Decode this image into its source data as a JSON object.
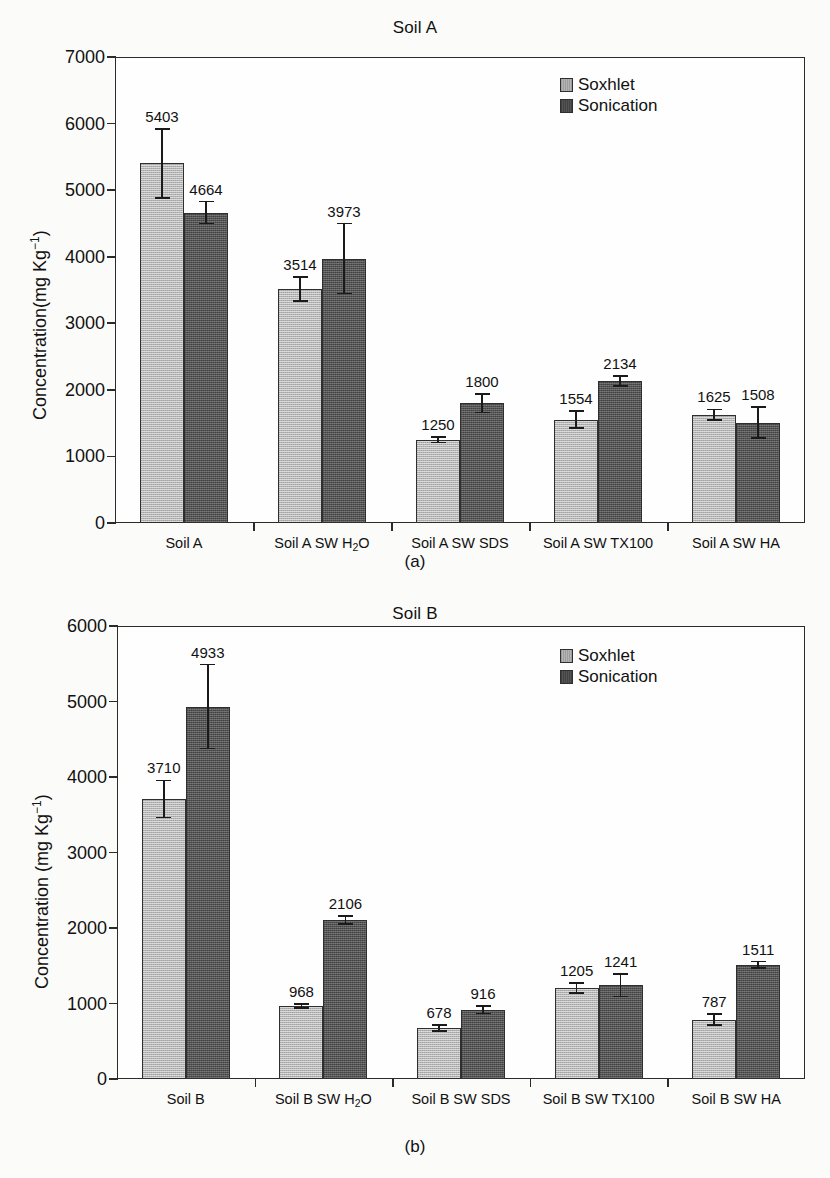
{
  "figure": {
    "legend_labels": [
      "Soxhlet",
      "Sonication"
    ],
    "colors": {
      "soxhlet": "#b4b4b4",
      "sonication": "#545454",
      "axis": "#2b2b2b",
      "text": "#111111"
    }
  },
  "panels": [
    {
      "id": "a",
      "caption": "(a)",
      "title": "Soil A",
      "ylabel_prefix": "Concentration(mg Kg",
      "ylabel_sup": "−1",
      "ylabel_suffix": ")",
      "yticks": [
        "0",
        "1000",
        "2000",
        "3000",
        "4000",
        "5000",
        "6000",
        "7000"
      ],
      "categories": [
        {
          "pre": "Soil A",
          "sub": "",
          "post": ""
        },
        {
          "pre": "Soil A SW H",
          "sub": "2",
          "post": "O"
        },
        {
          "pre": "Soil A SW SDS",
          "sub": "",
          "post": ""
        },
        {
          "pre": "Soil A SW TX100",
          "sub": "",
          "post": ""
        },
        {
          "pre": "Soil A SW HA",
          "sub": "",
          "post": ""
        }
      ],
      "value_labels": {
        "soxhlet": [
          "5403",
          "3514",
          "1250",
          "1554",
          "1625"
        ],
        "sonication": [
          "4664",
          "3973",
          "1800",
          "2134",
          "1508"
        ]
      }
    },
    {
      "id": "b",
      "caption": "(b)",
      "title": "Soil B",
      "ylabel_prefix": "Concentration (mg Kg",
      "ylabel_sup": "−1",
      "ylabel_suffix": ")",
      "yticks": [
        "0",
        "1000",
        "2000",
        "3000",
        "4000",
        "5000",
        "6000"
      ],
      "categories": [
        {
          "pre": "Soil B",
          "sub": "",
          "post": ""
        },
        {
          "pre": "Soil B SW H",
          "sub": "2",
          "post": "O"
        },
        {
          "pre": "Soil B SW SDS",
          "sub": "",
          "post": ""
        },
        {
          "pre": "Soil B SW TX100",
          "sub": "",
          "post": ""
        },
        {
          "pre": "Soil B SW HA",
          "sub": "",
          "post": ""
        }
      ],
      "value_labels": {
        "soxhlet": [
          "3710",
          "968",
          "678",
          "1205",
          "787"
        ],
        "sonication": [
          "4933",
          "2106",
          "916",
          "1241",
          "1511"
        ]
      }
    }
  ],
  "chart_data": [
    {
      "type": "bar",
      "panel": "a",
      "title": "Soil A",
      "xlabel": "",
      "ylabel": "Concentration(mg Kg⁻¹)",
      "ylim": [
        0,
        7000
      ],
      "ytick_values": [
        0,
        1000,
        2000,
        3000,
        4000,
        5000,
        6000,
        7000
      ],
      "grid": false,
      "legend_position": "top-right",
      "categories": [
        "Soil A",
        "Soil A SW H2O",
        "Soil A SW SDS",
        "Soil A SW TX100",
        "Soil A SW HA"
      ],
      "series": [
        {
          "name": "Soxhlet",
          "values": [
            5403,
            3514,
            1250,
            1554,
            1625
          ],
          "errors": [
            520,
            180,
            40,
            130,
            80
          ]
        },
        {
          "name": "Sonication",
          "values": [
            4664,
            3973,
            1800,
            2134,
            1508
          ],
          "errors": [
            165,
            525,
            140,
            75,
            235
          ]
        }
      ]
    },
    {
      "type": "bar",
      "panel": "b",
      "title": "Soil B",
      "xlabel": "",
      "ylabel": "Concentration (mg Kg⁻¹)",
      "ylim": [
        0,
        6000
      ],
      "ytick_values": [
        0,
        1000,
        2000,
        3000,
        4000,
        5000,
        6000
      ],
      "grid": false,
      "legend_position": "top-right",
      "categories": [
        "Soil B",
        "Soil B SW H2O",
        "Soil B SW SDS",
        "Soil B SW TX100",
        "Soil B SW HA"
      ],
      "series": [
        {
          "name": "Soxhlet",
          "values": [
            3710,
            968,
            678,
            1205,
            787
          ],
          "errors": [
            245,
            25,
            38,
            70,
            75
          ]
        },
        {
          "name": "Sonication",
          "values": [
            4933,
            2106,
            916,
            1241,
            1511
          ],
          "errors": [
            555,
            52,
            48,
            150,
            45
          ]
        }
      ]
    }
  ]
}
